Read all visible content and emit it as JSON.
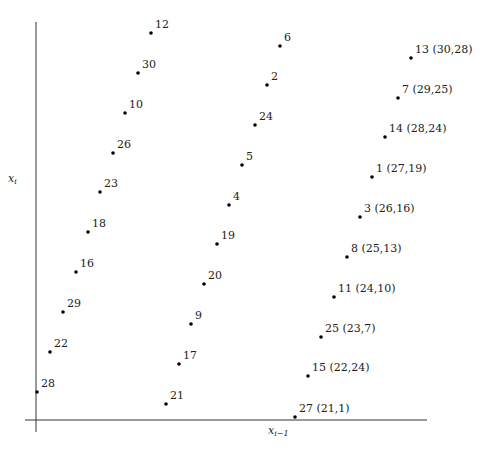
{
  "chart_data": {
    "type": "scatter",
    "title": "",
    "xlabel": "x_{i-1}",
    "ylabel": "x_i",
    "grid": false,
    "legend": null,
    "points": [
      {
        "label": "28",
        "col": 0,
        "row": 0,
        "px": 37,
        "py": 392
      },
      {
        "label": "22",
        "col": 0,
        "row": 1,
        "px": 50,
        "py": 352
      },
      {
        "label": "29",
        "col": 0,
        "row": 2,
        "px": 63,
        "py": 312
      },
      {
        "label": "16",
        "col": 0,
        "row": 3,
        "px": 76,
        "py": 272
      },
      {
        "label": "18",
        "col": 0,
        "row": 4,
        "px": 88,
        "py": 232
      },
      {
        "label": "23",
        "col": 0,
        "row": 5,
        "px": 100,
        "py": 192
      },
      {
        "label": "26",
        "col": 0,
        "row": 6,
        "px": 113,
        "py": 153
      },
      {
        "label": "10",
        "col": 0,
        "row": 7,
        "px": 125,
        "py": 113
      },
      {
        "label": "30",
        "col": 0,
        "row": 8,
        "px": 138,
        "py": 73
      },
      {
        "label": "12",
        "col": 0,
        "row": 9,
        "px": 151,
        "py": 33
      },
      {
        "label": "21",
        "col": 1,
        "row": 0,
        "px": 166,
        "py": 404
      },
      {
        "label": "17",
        "col": 1,
        "row": 1,
        "px": 179,
        "py": 364
      },
      {
        "label": "9",
        "col": 1,
        "row": 2,
        "px": 191,
        "py": 324
      },
      {
        "label": "20",
        "col": 1,
        "row": 3,
        "px": 204,
        "py": 284
      },
      {
        "label": "19",
        "col": 1,
        "row": 4,
        "px": 217,
        "py": 244
      },
      {
        "label": "4",
        "col": 1,
        "row": 5,
        "px": 229,
        "py": 205
      },
      {
        "label": "5",
        "col": 1,
        "row": 6,
        "px": 242,
        "py": 165
      },
      {
        "label": "24",
        "col": 1,
        "row": 7,
        "px": 255,
        "py": 125
      },
      {
        "label": "2",
        "col": 1,
        "row": 8,
        "px": 267,
        "py": 85
      },
      {
        "label": "6",
        "col": 1,
        "row": 9,
        "px": 280,
        "py": 46
      },
      {
        "label": "27 (21,1)",
        "col": 2,
        "row": 0,
        "px": 295,
        "py": 417,
        "x": 21,
        "y": 1
      },
      {
        "label": "15 (22,24)",
        "col": 2,
        "row": 1,
        "px": 308,
        "py": 376,
        "x": 22,
        "y": 24
      },
      {
        "label": "25 (23,7)",
        "col": 2,
        "row": 2,
        "px": 321,
        "py": 337,
        "x": 23,
        "y": 7
      },
      {
        "label": "11 (24,10)",
        "col": 2,
        "row": 3,
        "px": 334,
        "py": 297,
        "x": 24,
        "y": 10
      },
      {
        "label": "8 (25,13)",
        "col": 2,
        "row": 4,
        "px": 347,
        "py": 257,
        "x": 25,
        "y": 13
      },
      {
        "label": "3 (26,16)",
        "col": 2,
        "row": 5,
        "px": 360,
        "py": 217,
        "x": 26,
        "y": 16
      },
      {
        "label": "1 (27,19)",
        "col": 2,
        "row": 6,
        "px": 372,
        "py": 177,
        "x": 27,
        "y": 19
      },
      {
        "label": "14 (28,24)",
        "col": 2,
        "row": 7,
        "px": 385,
        "py": 137,
        "x": 28,
        "y": 24
      },
      {
        "label": "7 (29,25)",
        "col": 2,
        "row": 8,
        "px": 398,
        "py": 98,
        "x": 29,
        "y": 25
      },
      {
        "label": "13 (30,28)",
        "col": 2,
        "row": 9,
        "px": 411,
        "py": 58,
        "x": 30,
        "y": 28
      }
    ],
    "axes": {
      "y_axis": {
        "x": 36,
        "y1": 22,
        "y2": 432
      },
      "x_axis": {
        "y": 420,
        "x1": 25,
        "x2": 427
      }
    }
  },
  "labels": {
    "ylabel_main": "x",
    "ylabel_sub": "i",
    "xlabel_main": "x",
    "xlabel_sub": "i−1"
  }
}
